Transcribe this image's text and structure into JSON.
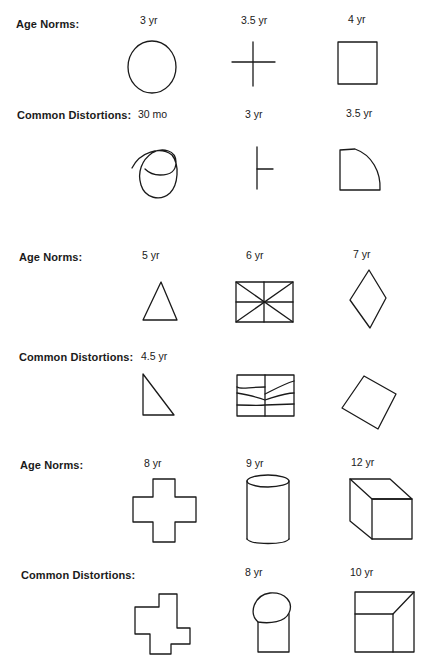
{
  "sections": [
    {
      "norms_label": "Age Norms:",
      "norms": [
        {
          "age": "3 yr",
          "shape": "circle"
        },
        {
          "age": "3.5 yr",
          "shape": "cross"
        },
        {
          "age": "4 yr",
          "shape": "square"
        }
      ],
      "distortions_label": "Common Distortions:",
      "distortions": [
        {
          "age": "30 mo",
          "shape": "scribbled-circle"
        },
        {
          "age": "3 yr",
          "shape": "t-cross"
        },
        {
          "age": "3.5 yr",
          "shape": "rounded-square"
        }
      ]
    },
    {
      "norms_label": "Age Norms:",
      "norms": [
        {
          "age": "5 yr",
          "shape": "triangle"
        },
        {
          "age": "6 yr",
          "shape": "divided-rectangle"
        },
        {
          "age": "7 yr",
          "shape": "diamond"
        }
      ],
      "distortions_label": "Common Distortions:",
      "distortions": [
        {
          "age": "4.5 yr",
          "shape": "right-triangle"
        },
        {
          "age": "",
          "shape": "wavy-divided-rectangle"
        },
        {
          "age": "",
          "shape": "rotated-square"
        }
      ]
    },
    {
      "norms_label": "Age Norms:",
      "norms": [
        {
          "age": "8 yr",
          "shape": "greek-cross"
        },
        {
          "age": "9 yr",
          "shape": "cylinder"
        },
        {
          "age": "12 yr",
          "shape": "cube"
        }
      ],
      "distortions_label": "Common Distortions:",
      "distortions": [
        {
          "age": "",
          "shape": "offset-cross"
        },
        {
          "age": "8 yr",
          "shape": "flat-cylinder"
        },
        {
          "age": "10 yr",
          "shape": "flat-cube"
        }
      ]
    }
  ]
}
